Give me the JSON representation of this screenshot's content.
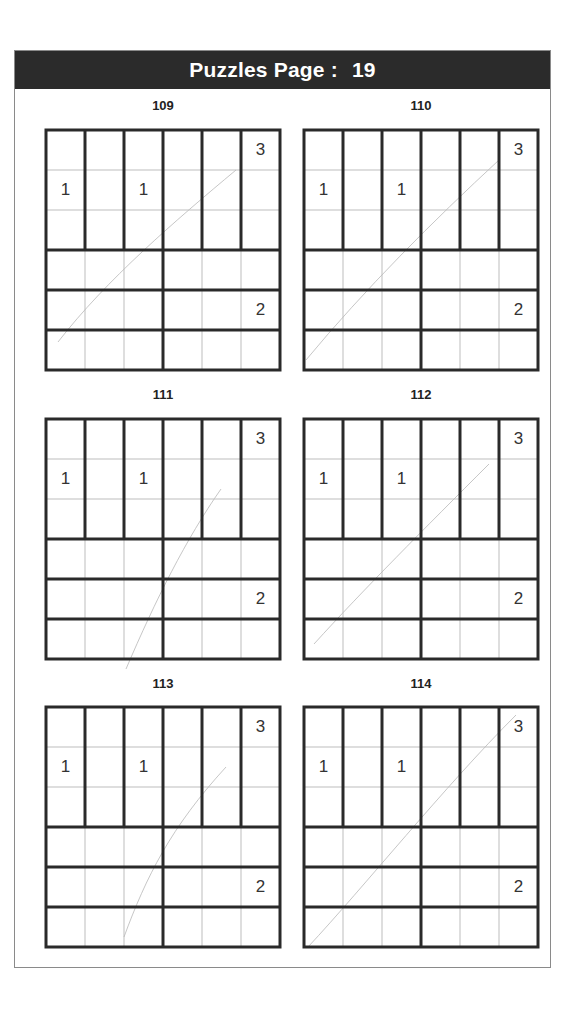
{
  "header": {
    "title": "Puzzles Page :",
    "page_number": "19"
  },
  "puzzles": [
    {
      "label": "109",
      "givens": [
        {
          "r": 0,
          "c": 5,
          "v": "3"
        },
        {
          "r": 1,
          "c": 0,
          "v": "1"
        },
        {
          "r": 1,
          "c": 2,
          "v": "1"
        },
        {
          "r": 4,
          "c": 5,
          "v": "2"
        }
      ]
    },
    {
      "label": "110",
      "givens": [
        {
          "r": 0,
          "c": 5,
          "v": "3"
        },
        {
          "r": 1,
          "c": 0,
          "v": "1"
        },
        {
          "r": 1,
          "c": 2,
          "v": "1"
        },
        {
          "r": 4,
          "c": 5,
          "v": "2"
        }
      ]
    },
    {
      "label": "111",
      "givens": [
        {
          "r": 0,
          "c": 5,
          "v": "3"
        },
        {
          "r": 1,
          "c": 0,
          "v": "1"
        },
        {
          "r": 1,
          "c": 2,
          "v": "1"
        },
        {
          "r": 4,
          "c": 5,
          "v": "2"
        }
      ]
    },
    {
      "label": "112",
      "givens": [
        {
          "r": 0,
          "c": 5,
          "v": "3"
        },
        {
          "r": 1,
          "c": 0,
          "v": "1"
        },
        {
          "r": 1,
          "c": 2,
          "v": "1"
        },
        {
          "r": 4,
          "c": 5,
          "v": "2"
        }
      ]
    },
    {
      "label": "113",
      "givens": [
        {
          "r": 0,
          "c": 5,
          "v": "3"
        },
        {
          "r": 1,
          "c": 0,
          "v": "1"
        },
        {
          "r": 1,
          "c": 2,
          "v": "1"
        },
        {
          "r": 4,
          "c": 5,
          "v": "2"
        }
      ]
    },
    {
      "label": "114",
      "givens": [
        {
          "r": 0,
          "c": 5,
          "v": "3"
        },
        {
          "r": 1,
          "c": 0,
          "v": "1"
        },
        {
          "r": 1,
          "c": 2,
          "v": "1"
        },
        {
          "r": 4,
          "c": 5,
          "v": "2"
        }
      ]
    }
  ],
  "grid": {
    "size": 6,
    "cages": "top rows 0-2: six vertical 3-cell columns; rows 3,4,5: two horizontal 3-cell cages each (cols 0-2, cols 3-5)"
  },
  "colors": {
    "header_bg": "#2b2b2b",
    "header_text": "#ffffff",
    "thick_line": "#2a2a2a",
    "thin_line": "#bdbdbd"
  }
}
